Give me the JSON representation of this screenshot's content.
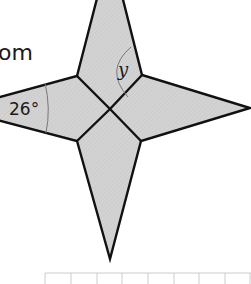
{
  "partial_text": "om",
  "figure": {
    "shape": "four-pointed star made of four kites",
    "fill_color": "#d3d3d3",
    "stroke_color": "#111111",
    "arc_color": "#777777",
    "angle_label": "26°",
    "variable_label": "y"
  },
  "grid": {
    "line_color": "#cccccc",
    "columns": 8
  }
}
